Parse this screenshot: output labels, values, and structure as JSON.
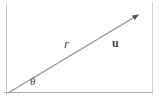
{
  "figure": {
    "background_color": "#ffffff",
    "stroke_color": "#9a9a9a",
    "label_color": "#4a4a4a",
    "frame": {
      "left_border": true,
      "right_border": true,
      "top_border": false,
      "bottom_border": false
    },
    "axis": {
      "name": "horizontal-reference-axis",
      "x1": 4,
      "y1": 92,
      "x2": 152,
      "y2": 92
    },
    "ray": {
      "name": "vector-ray",
      "x1": 8,
      "y1": 93,
      "x2": 141,
      "y2": 13,
      "arrowhead": true,
      "angle_degrees": 31
    },
    "labels": {
      "radius": "r",
      "vector": "u",
      "angle": "θ"
    }
  }
}
